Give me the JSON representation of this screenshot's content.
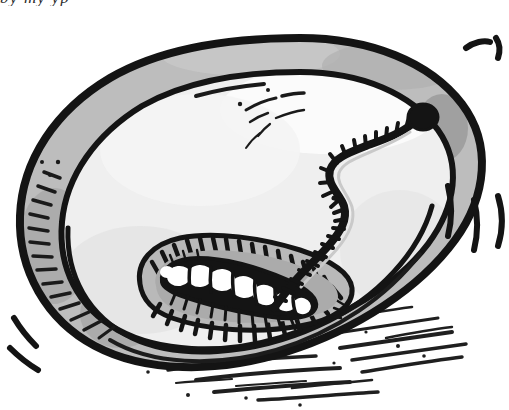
{
  "page": {
    "width": 509,
    "height": 410,
    "background_color": "#ffffff",
    "medium": "pen-and-ink line drawing with gray wash"
  },
  "clipped_caption": {
    "visible_fragment": "by my yp",
    "note": "only the descender tips of a line of italic text are visible at the very top edge of the image; the line is cropped off"
  },
  "artwork": {
    "title": "Oyster shell with worm",
    "parts": [
      {
        "name": "shell-outer-outline",
        "label": "Outer shell rim outline"
      },
      {
        "name": "shell-rim-band",
        "label": "Gray shell rim band"
      },
      {
        "name": "shell-inner-outline",
        "label": "Inner shell wall outline"
      },
      {
        "name": "oyster-body",
        "label": "Pale oyster flesh"
      },
      {
        "name": "worm-body",
        "label": "Segmented worm body"
      },
      {
        "name": "worm-head",
        "label": "Round dark worm head"
      },
      {
        "name": "grub-body",
        "label": "White segmented grub"
      },
      {
        "name": "grub-cavity",
        "label": "Hatched cavity around grub"
      },
      {
        "name": "ground-shadow",
        "label": "Hatched ground shadow"
      },
      {
        "name": "motion-lines-right-top",
        "label": "Emphasis lines, upper right"
      },
      {
        "name": "motion-lines-right-mid",
        "label": "Emphasis lines, mid right"
      },
      {
        "name": "motion-lines-left",
        "label": "Emphasis lines, lower left"
      }
    ]
  },
  "colors": {
    "ink": "#1a1a1a",
    "ink_soft": "#2e2e2e",
    "rim_gray": "#b8b8b8",
    "rim_gray_dark": "#a0a0a0",
    "rim_gray_light": "#cccccc",
    "flesh": "#ededed",
    "flesh_light": "#f6f6f6",
    "cavity_gray": "#b4b4b4",
    "white": "#ffffff",
    "background": "#ffffff"
  }
}
